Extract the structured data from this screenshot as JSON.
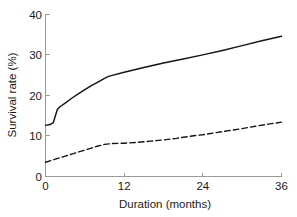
{
  "chart_data": {
    "type": "line",
    "title": "",
    "xlabel": "Duration (months)",
    "ylabel": "Survival rate (%)",
    "xlim": [
      0,
      36
    ],
    "ylim": [
      0,
      40
    ],
    "xticks": [
      0,
      12,
      24,
      36
    ],
    "xtick_labels": [
      "0",
      "12",
      "24",
      "36"
    ],
    "yticks": [
      0,
      10,
      20,
      30,
      40
    ],
    "ytick_labels": [
      "0",
      "10",
      "20",
      "30",
      "40"
    ],
    "grid": false,
    "legend": null,
    "series": [
      {
        "name": "upper-curve",
        "style": "solid",
        "color": "#151515",
        "x": [
          0,
          0.7,
          1.2,
          1.5,
          1.8,
          2.2,
          3,
          4,
          5,
          6,
          7,
          8,
          9,
          9.6,
          12,
          15,
          18,
          21,
          24,
          27,
          30,
          33,
          36
        ],
        "values": [
          12.5,
          12.7,
          13.2,
          14.8,
          16.4,
          17.1,
          18.0,
          19.2,
          20.3,
          21.3,
          22.3,
          23.2,
          24.1,
          24.6,
          25.6,
          26.8,
          27.9,
          28.9,
          29.9,
          31.0,
          32.2,
          33.4,
          34.5
        ]
      },
      {
        "name": "lower-curve",
        "style": "dashed",
        "color": "#151515",
        "x": [
          0,
          1,
          2,
          3,
          4,
          5,
          6,
          7,
          8,
          9,
          10,
          12,
          14,
          16,
          18,
          20,
          22,
          24,
          26,
          28,
          30,
          32,
          34,
          36
        ],
        "values": [
          3.4,
          3.9,
          4.4,
          4.9,
          5.4,
          5.9,
          6.4,
          6.9,
          7.4,
          7.8,
          8.0,
          8.1,
          8.3,
          8.6,
          8.9,
          9.3,
          9.8,
          10.2,
          10.7,
          11.2,
          11.7,
          12.3,
          12.8,
          13.3
        ]
      }
    ],
    "axes": {
      "left_spine": true,
      "bottom_spine": true,
      "top_spine": false,
      "right_spine": false
    }
  }
}
